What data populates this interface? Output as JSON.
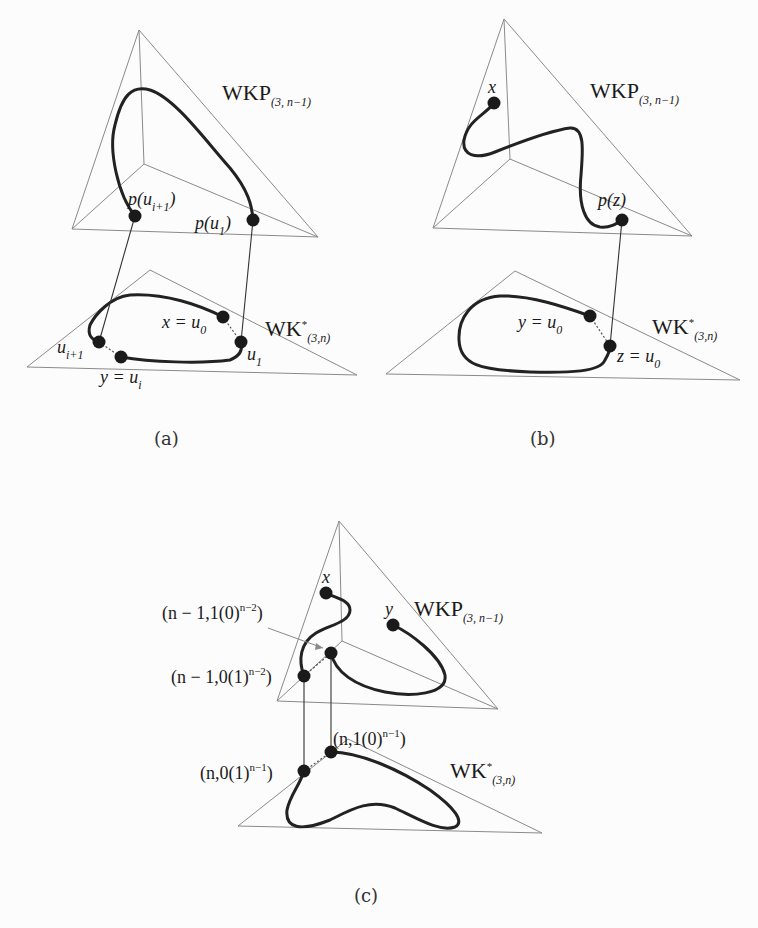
{
  "figure": {
    "panels": [
      {
        "id": "a",
        "caption": "(a)",
        "upper_label": {
          "base": "WKP",
          "sub": "(3, n−1)"
        },
        "lower_label": {
          "base": "WK",
          "sup": "*",
          "sub": "(3,n)"
        },
        "points": {
          "p_ui1": {
            "text": "p(u",
            "sub": "i+1",
            "close": ")"
          },
          "p_u1": {
            "text": "p(u",
            "sub": "1",
            "close": ")"
          },
          "x_u0": {
            "text": "x = u",
            "sub": "0"
          },
          "u1": {
            "text": "u",
            "sub": "1"
          },
          "ui1": {
            "text": "u",
            "sub": "i+1"
          },
          "y_ui": {
            "text": "y = u",
            "sub": "i"
          }
        }
      },
      {
        "id": "b",
        "caption": "(b)",
        "upper_label": {
          "base": "WKP",
          "sub": "(3, n−1)"
        },
        "lower_label": {
          "base": "WK",
          "sup": "*",
          "sub": "(3,n)"
        },
        "points": {
          "x": {
            "text": "x"
          },
          "pz": {
            "text": "p(z)"
          },
          "y_u0": {
            "text": "y = u",
            "sub": "0"
          },
          "z_u0": {
            "text": "z = u",
            "sub": "0"
          }
        }
      },
      {
        "id": "c",
        "caption": "(c)",
        "upper_label": {
          "base": "WKP",
          "sub": "(3, n−1)"
        },
        "lower_label": {
          "base": "WK",
          "sup": "*",
          "sub": "(3,n)"
        },
        "points": {
          "x": {
            "text": "x"
          },
          "y": {
            "text": "y"
          },
          "n1_10": {
            "pre": "(n − 1,1(0)",
            "sup": "n−2",
            "post": ")"
          },
          "n1_01": {
            "pre": "(n − 1,0(1)",
            "sup": "n−2",
            "post": ")"
          },
          "n_10": {
            "pre": "(n,1(0)",
            "sup": "n−1",
            "post": ")"
          },
          "n_01": {
            "pre": "(n,0(1)",
            "sup": "n−1",
            "post": ")"
          }
        }
      }
    ]
  }
}
